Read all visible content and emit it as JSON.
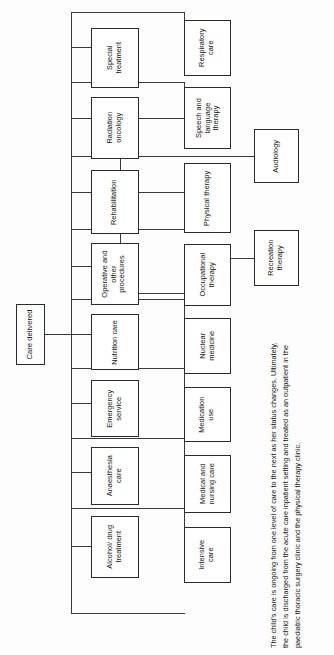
{
  "diagram": {
    "title": "Care delivered",
    "type": "hierarchy-tree",
    "orientation": "rotated-90-ccw",
    "root": {
      "label": "Care delivered"
    },
    "level1": [
      {
        "label": "Special treatment"
      },
      {
        "label": "Radiation oncology"
      },
      {
        "label": "Rehabilitation"
      },
      {
        "label": "Operative and other procedures"
      },
      {
        "label": "Nutrition care"
      },
      {
        "label": "Emergency service"
      },
      {
        "label": "Anaesthesia care"
      },
      {
        "label": "Alcohol/ drug treatment"
      }
    ],
    "level2": [
      {
        "label": "Respiratory care"
      },
      {
        "label": "Speech and language therapy"
      },
      {
        "label": "Physical therapy"
      },
      {
        "label": "Occupational therapy"
      },
      {
        "label": "Nuclear medicine"
      },
      {
        "label": "Medication use"
      },
      {
        "label": "Medical and nursing care"
      },
      {
        "label": "Intensive care"
      }
    ],
    "level3": [
      {
        "label": "Audiology"
      },
      {
        "label": "Recreation therapy"
      }
    ]
  },
  "caption": {
    "text": "The child's care is ongoing from one level of care to the next as her status changes. Ultimately, the child is discharged from the acute care inpatient setting and treated as an outpatient in the paediatric thoracic surgery clinic and the physical therapy clinic."
  },
  "colors": {
    "box_border": "#2b2b2b",
    "line": "#3a3a3a",
    "text": "#141414",
    "background": "#fdfdfd"
  }
}
